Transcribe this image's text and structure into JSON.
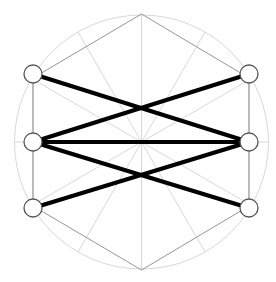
{
  "figure": {
    "title": "",
    "type": "graph-diagram",
    "width": 276,
    "height": 282,
    "background_color": "#ffffff",
    "colors": {
      "guide_circle": "#d8d8d8",
      "guide_hexagon": "#c0c0c0",
      "guide_spoke": "#d4d4d4",
      "guide_side_rail": "#a8a8a8",
      "hex_edge_dark": "#8a8a8a",
      "node_stroke": "#555555",
      "node_fill": "#ffffff",
      "graph_edge": "#000000",
      "center_dot": "#b5b5b5"
    },
    "geometry": {
      "center": {
        "x": 141.5,
        "y": 142
      },
      "circle_radius": 127,
      "node_radius": 9,
      "node_stroke_width": 1.3,
      "edge_stroke_width": 4.2,
      "guide_stroke_width": 0.9,
      "spoke_count": 12,
      "spoke_step_degrees": 30
    },
    "hexagon_vertices": [
      {
        "name": "hex-top",
        "x": 141.5,
        "y": 14
      },
      {
        "name": "hex-upper-right",
        "x": 249,
        "y": 78
      },
      {
        "name": "hex-lower-right",
        "x": 249,
        "y": 206
      },
      {
        "name": "hex-bottom",
        "x": 141.5,
        "y": 270
      },
      {
        "name": "hex-lower-left",
        "x": 33,
        "y": 206
      },
      {
        "name": "hex-upper-left",
        "x": 33,
        "y": 78
      }
    ],
    "nodes": [
      {
        "id": "n1",
        "label": "",
        "name": "node-top-left",
        "x": 33,
        "y": 74
      },
      {
        "id": "n2",
        "label": "",
        "name": "node-top-right",
        "x": 249,
        "y": 74
      },
      {
        "id": "n3",
        "label": "",
        "name": "node-middle-left",
        "x": 33,
        "y": 142
      },
      {
        "id": "n4",
        "label": "",
        "name": "node-middle-right",
        "x": 249,
        "y": 142
      },
      {
        "id": "n5",
        "label": "",
        "name": "node-bottom-left",
        "x": 33,
        "y": 208
      },
      {
        "id": "n6",
        "label": "",
        "name": "node-bottom-right",
        "x": 249,
        "y": 208
      }
    ],
    "edges": [
      {
        "name": "edge-top-left-to-middle-right",
        "from": "n1",
        "to": "n4"
      },
      {
        "name": "edge-middle-left-to-top-right",
        "from": "n3",
        "to": "n2"
      },
      {
        "name": "edge-middle-left-to-middle-right",
        "from": "n3",
        "to": "n4"
      },
      {
        "name": "edge-middle-left-to-bottom-right",
        "from": "n3",
        "to": "n6"
      },
      {
        "name": "edge-bottom-left-to-middle-right",
        "from": "n5",
        "to": "n4"
      }
    ],
    "side_rails": [
      {
        "name": "rail-left",
        "x1": 33,
        "y1": 74,
        "x2": 33,
        "y2": 208
      },
      {
        "name": "rail-right",
        "x1": 249,
        "y1": 74,
        "x2": 249,
        "y2": 208
      }
    ]
  }
}
